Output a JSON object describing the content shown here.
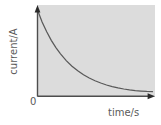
{
  "figure": {
    "name": "current-time-decay-graph",
    "background_color": "#ffffff",
    "plot_background_color": "#dcdcdc",
    "axis_color": "#4d4d4d",
    "curve_color": "#595959",
    "label_color": "#5a5a5a"
  },
  "labels": {
    "y_axis": "current/A",
    "x_axis": "time/s",
    "origin": "0"
  },
  "chart_data": {
    "type": "line",
    "title": "",
    "xlabel": "time/s",
    "ylabel": "current/A",
    "xlim": [
      0,
      1
    ],
    "ylim": [
      0,
      1
    ],
    "grid": false,
    "legend": false,
    "axis_ticks": [],
    "annotations": [
      "0"
    ],
    "series": [
      {
        "name": "current",
        "description": "exponential decay of current with time",
        "x": [
          0.0,
          0.04,
          0.08,
          0.12,
          0.16,
          0.2,
          0.25,
          0.3,
          0.35,
          0.4,
          0.45,
          0.5,
          0.55,
          0.6,
          0.65,
          0.7,
          0.75,
          0.8,
          0.85,
          0.9,
          0.95,
          1.0
        ],
        "y": [
          1.0,
          0.86,
          0.745,
          0.645,
          0.56,
          0.487,
          0.408,
          0.343,
          0.289,
          0.243,
          0.205,
          0.173,
          0.146,
          0.123,
          0.105,
          0.089,
          0.076,
          0.066,
          0.058,
          0.052,
          0.047,
          0.044
        ]
      }
    ]
  }
}
